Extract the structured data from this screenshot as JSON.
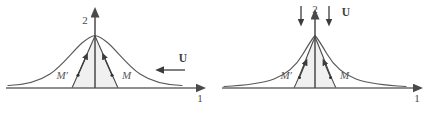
{
  "figure": {
    "type": "diagram",
    "background_color": "#ffffff",
    "stroke_color": "#5a5a5a",
    "fill_color": "#f0f0f0",
    "panels": [
      {
        "id": "left",
        "name": "smooth-peak-panel",
        "axes": {
          "horizontal_label": "1",
          "vertical_label": "2"
        },
        "curve": {
          "name": "broad-bell-curve",
          "shape": "gaussian",
          "peak_height_px": 52,
          "half_width_px": 55
        },
        "shaded_region": {
          "name": "triangular-shaded-region",
          "shape": "tent",
          "base_left_px": 72,
          "base_right_px": 118,
          "apex_px": 95
        },
        "point_labels": [
          {
            "name": "m-prime-label",
            "text": "M′"
          },
          {
            "name": "m-label",
            "text": "M"
          }
        ],
        "velocity_vector": {
          "name": "velocity-vector-u",
          "label": "U",
          "direction": "left"
        }
      },
      {
        "id": "right",
        "name": "cusp-peak-panel",
        "axes": {
          "horizontal_label": "1",
          "vertical_label": "2"
        },
        "curve": {
          "name": "sharp-cusp-curve",
          "shape": "lorentzian-cusp",
          "peak_height_px": 52,
          "half_width_px": 18
        },
        "shaded_region": {
          "name": "concave-shaded-region",
          "shape": "concave-tent",
          "base_left_px": 29,
          "base_right_px": 71,
          "apex_px": 50
        },
        "point_labels": [
          {
            "name": "m-prime-label",
            "text": "M′"
          },
          {
            "name": "m-label",
            "text": "M"
          }
        ],
        "velocity_vector": {
          "name": "velocity-vector-u",
          "label": "U",
          "direction": "down",
          "arrow_count": 2
        }
      }
    ]
  }
}
